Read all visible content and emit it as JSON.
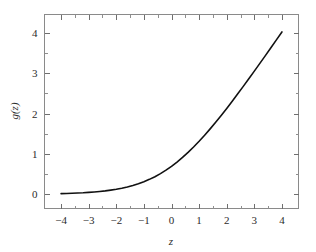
{
  "chart_data": {
    "type": "line",
    "title": "",
    "xlabel": "z",
    "ylabel": "g(z)",
    "xlim": [
      -4.6,
      4.6
    ],
    "ylim": [
      -0.35,
      4.45
    ],
    "grid": false,
    "legend": null,
    "function": "g(z) = ln(1 + e^z)",
    "xticks": [
      -4,
      -3,
      -2,
      -1,
      0,
      1,
      2,
      3,
      4
    ],
    "xticklabels": [
      "−4",
      "−3",
      "−2",
      "−1",
      "0",
      "1",
      "2",
      "3",
      "4"
    ],
    "xminorticks": [
      -3.5,
      -2.5,
      -1.5,
      -0.5,
      0.5,
      1.5,
      2.5,
      3.5
    ],
    "yticks": [
      0,
      1,
      2,
      3,
      4
    ],
    "yticklabels": [
      "0",
      "1",
      "2",
      "3",
      "4"
    ],
    "yminorticks": [
      0.5,
      1.5,
      2.5,
      3.5
    ],
    "series": [
      {
        "name": "softplus",
        "color": "#111111",
        "linewidth": 1.6,
        "x": [
          -4.0,
          -3.8,
          -3.6,
          -3.4,
          -3.2,
          -3.0,
          -2.8,
          -2.6,
          -2.4,
          -2.2,
          -2.0,
          -1.8,
          -1.6,
          -1.4,
          -1.2,
          -1.0,
          -0.8,
          -0.6,
          -0.4,
          -0.2,
          0.0,
          0.2,
          0.4,
          0.6,
          0.8,
          1.0,
          1.2,
          1.4,
          1.6,
          1.8,
          2.0,
          2.2,
          2.4,
          2.6,
          2.8,
          3.0,
          3.2,
          3.4,
          3.6,
          3.8,
          4.0
        ],
        "y": [
          0.018,
          0.022,
          0.027,
          0.033,
          0.039,
          0.049,
          0.059,
          0.071,
          0.086,
          0.105,
          0.127,
          0.153,
          0.184,
          0.221,
          0.263,
          0.313,
          0.371,
          0.437,
          0.513,
          0.598,
          0.693,
          0.798,
          0.913,
          1.037,
          1.171,
          1.313,
          1.463,
          1.62,
          1.784,
          1.954,
          2.127,
          2.305,
          2.487,
          2.672,
          2.86,
          3.049,
          3.24,
          3.432,
          3.627,
          3.822,
          4.018
        ]
      }
    ]
  },
  "axes": {
    "frame_color": "#8a8a8a",
    "tick_color": "#6f6f6f",
    "background": "#ffffff"
  }
}
